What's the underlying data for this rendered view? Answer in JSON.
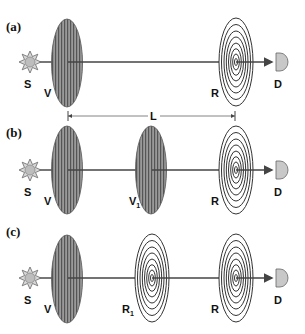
{
  "figure": {
    "panels": [
      {
        "label": "(a)",
        "components": [
          {
            "type": "source",
            "label": "S"
          },
          {
            "type": "vortex-plate",
            "label": "V"
          },
          {
            "type": "zone-plate",
            "label": "R"
          },
          {
            "type": "detector",
            "label": "D"
          }
        ]
      },
      {
        "label": "(b)",
        "components": [
          {
            "type": "source",
            "label": "S"
          },
          {
            "type": "vortex-plate",
            "label": "V"
          },
          {
            "type": "vortex-plate",
            "label": "V",
            "subscript": "1"
          },
          {
            "type": "zone-plate",
            "label": "R"
          },
          {
            "type": "detector",
            "label": "D"
          }
        ]
      },
      {
        "label": "(c)",
        "components": [
          {
            "type": "source",
            "label": "S"
          },
          {
            "type": "vortex-plate",
            "label": "V"
          },
          {
            "type": "zone-plate",
            "label": "R",
            "subscript": "1"
          },
          {
            "type": "zone-plate",
            "label": "R"
          },
          {
            "type": "detector",
            "label": "D"
          }
        ]
      }
    ],
    "dimension": {
      "label": "L"
    },
    "colors": {
      "hatched_fill": "#8a8a8a",
      "line": "#444444",
      "source_fill": "#cfcfcf",
      "detector_fill": "#c8c8c8"
    }
  }
}
